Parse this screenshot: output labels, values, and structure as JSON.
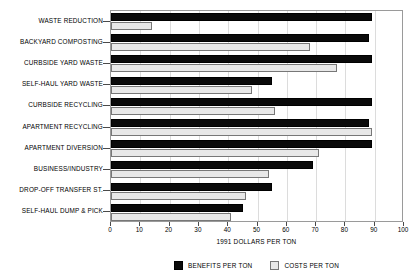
{
  "chart_data": {
    "type": "bar",
    "orientation": "horizontal",
    "title": "",
    "xlabel": "1991 DOLLARS PER TON",
    "ylabel": "",
    "xlim": [
      0,
      100
    ],
    "xticks": [
      0,
      10,
      20,
      30,
      40,
      50,
      60,
      70,
      80,
      90,
      100
    ],
    "grid": true,
    "legend_position": "bottom",
    "categories": [
      "WASTE REDUCTION",
      "BACKYARD COMPOSTING",
      "CURBSIDE YARD WASTE",
      "SELF-HAUL YARD WASTE",
      "CURBSIDE RECYCLING",
      "APARTMENT RECYCLING",
      "APARTMENT DIVERSION",
      "BUSINESS/INDUSTRY",
      "DROP-OFF TRANSFER ST.",
      "SELF-HAUL DUMP & PICK"
    ],
    "series": [
      {
        "name": "BENEFITS PER TON",
        "color": "#0a0a0a",
        "values": [
          89,
          88,
          89,
          55,
          89,
          88,
          89,
          69,
          55,
          45
        ]
      },
      {
        "name": "COSTS PER TON",
        "color": "#e8e8e8",
        "values": [
          14,
          68,
          77,
          48,
          56,
          89,
          71,
          54,
          46,
          41
        ]
      }
    ]
  },
  "legend": {
    "items": [
      {
        "label": "BENEFITS PER TON"
      },
      {
        "label": "COSTS PER TON"
      }
    ]
  }
}
